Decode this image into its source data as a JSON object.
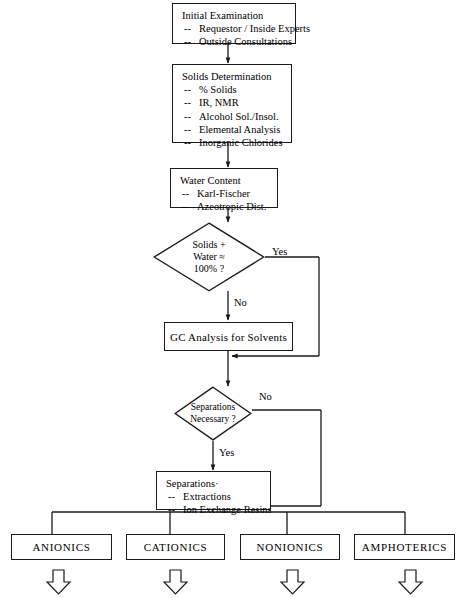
{
  "diagram": {
    "type": "flowchart",
    "stroke_color": "#1a1a1a",
    "background_color": "#ffffff"
  },
  "nodes": {
    "initial_examination": {
      "shape": "process",
      "title": "Initial Examination",
      "items": [
        "Requestor / Inside Experts",
        "Outside Consultations"
      ]
    },
    "solids_determination": {
      "shape": "process",
      "title": "Solids Determination",
      "items": [
        "% Solids",
        "IR, NMR",
        "Alcohol Sol./Insol.",
        "Elemental Analysis",
        "Inorganic Chlorides"
      ]
    },
    "water_content": {
      "shape": "process",
      "title": "Water Content",
      "items": [
        "Karl-Fischer",
        "Azeotropic Dist."
      ]
    },
    "solids_water_check": {
      "shape": "decision",
      "lines": [
        "Solids +",
        "Water ≈",
        "100% ?"
      ]
    },
    "gc_analysis": {
      "shape": "process",
      "label": "GC Analysis for Solvents"
    },
    "separations_check": {
      "shape": "decision",
      "lines": [
        "Separations",
        "Necessary ?"
      ]
    },
    "separations": {
      "shape": "process",
      "title": "Separations·",
      "items": [
        "Extractions",
        "Ion Exchange Resins"
      ]
    },
    "anionics": {
      "shape": "terminal",
      "label": "ANIONICS"
    },
    "cationics": {
      "shape": "terminal",
      "label": "CATIONICS"
    },
    "nonionics": {
      "shape": "terminal",
      "label": "NONIONICS"
    },
    "amphoterics": {
      "shape": "terminal",
      "label": "AMPHOTERICS"
    }
  },
  "edge_labels": {
    "solids_water_yes": "Yes",
    "solids_water_no": "No",
    "separations_no": "No",
    "separations_yes": "Yes"
  },
  "bullet_marker": "--"
}
